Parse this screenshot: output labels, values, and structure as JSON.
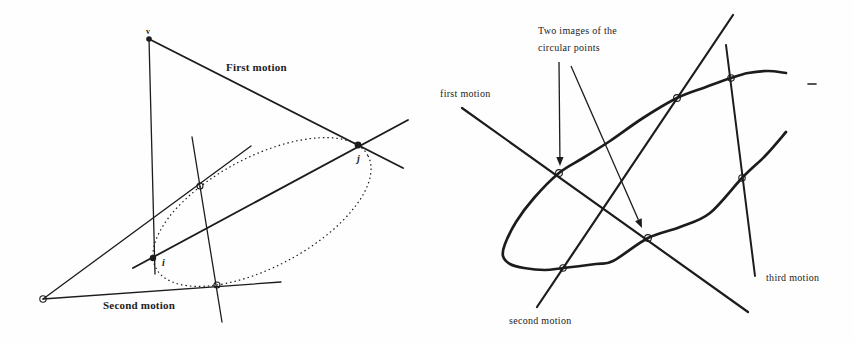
{
  "canvas": {
    "width": 854,
    "height": 342,
    "background": "#fefefe",
    "ink": "#1c1c1c"
  },
  "figures": [
    {
      "id": "left-figure",
      "description": "two-motion construction with dotted conic through circular points i and j",
      "labels": [
        {
          "id": "vertex-v-label",
          "text": "v",
          "x": 146,
          "y": 34,
          "cls": "lbl-tiny"
        },
        {
          "id": "first-motion-label",
          "text": "First motion",
          "x": 226,
          "y": 71,
          "cls": "lbl-bold"
        },
        {
          "id": "second-motion-label",
          "text": "Second motion",
          "x": 103,
          "y": 309,
          "cls": "lbl-bold"
        },
        {
          "id": "point-i-label",
          "text": "i",
          "x": 162,
          "y": 266,
          "cls": "lbl-pt"
        },
        {
          "id": "point-j-label",
          "text": "j",
          "x": 357,
          "y": 162,
          "cls": "lbl-pt"
        }
      ],
      "lines": [
        {
          "id": "vertical-axis-line",
          "x1": 149,
          "y1": 39,
          "x2": 155,
          "y2": 274,
          "w": 1.3
        },
        {
          "id": "first-motion-line",
          "x1": 149,
          "y1": 39,
          "x2": 403,
          "y2": 168,
          "w": 1.8
        },
        {
          "id": "i-j-diagonal-line",
          "x1": 133,
          "y1": 268,
          "x2": 408,
          "y2": 120,
          "w": 1.8
        },
        {
          "id": "upper-tangent-line",
          "x1": 43,
          "y1": 299,
          "x2": 251,
          "y2": 146,
          "w": 1.3
        },
        {
          "id": "second-motion-line",
          "x1": 43,
          "y1": 299,
          "x2": 281,
          "y2": 282,
          "w": 1.3
        },
        {
          "id": "tangency-chord-line",
          "x1": 192,
          "y1": 137,
          "x2": 222,
          "y2": 322,
          "w": 1.3
        }
      ],
      "dotted_ellipses": [
        {
          "id": "dotted-conic",
          "cx": 262,
          "cy": 212,
          "rx": 120,
          "ry": 55,
          "rotate": -28,
          "w": 1.2,
          "dash": "1.5 3"
        }
      ],
      "points": [
        {
          "id": "vertex-v-point",
          "x": 149,
          "y": 39,
          "type": "filled",
          "r": 2.8
        },
        {
          "id": "circular-point-i",
          "x": 153,
          "y": 258,
          "type": "filled",
          "r": 3.2
        },
        {
          "id": "circular-point-j",
          "x": 358,
          "y": 145,
          "type": "filled",
          "r": 3.4
        },
        {
          "id": "upper-tangency-point",
          "x": 200,
          "y": 186,
          "type": "open",
          "r": 3.0
        },
        {
          "id": "lower-tangency-point",
          "x": 217,
          "y": 285,
          "type": "open",
          "r": 3.0
        },
        {
          "id": "left-vertex-point",
          "x": 43,
          "y": 299,
          "type": "open",
          "r": 3.2
        }
      ]
    },
    {
      "id": "right-figure",
      "description": "bold conic with three motion lines meeting at two images of the circular points",
      "labels": [
        {
          "id": "annotation-line-1",
          "text": "Two images of the",
          "x": 538,
          "y": 34,
          "cls": "lbl"
        },
        {
          "id": "annotation-line-2",
          "text": "circular points",
          "x": 538,
          "y": 51,
          "cls": "lbl"
        },
        {
          "id": "first-motion-label",
          "text": "first motion",
          "x": 440,
          "y": 97,
          "cls": "lbl"
        },
        {
          "id": "second-motion-label",
          "text": "second motion",
          "x": 509,
          "y": 324,
          "cls": "lbl"
        },
        {
          "id": "third-motion-label",
          "text": "third motion",
          "x": 766,
          "y": 281,
          "cls": "lbl"
        }
      ],
      "lines": [
        {
          "id": "first-motion-line",
          "x1": 462,
          "y1": 108,
          "x2": 748,
          "y2": 312,
          "w": 2.2
        },
        {
          "id": "second-motion-line",
          "x1": 537,
          "y1": 307,
          "x2": 733,
          "y2": 15,
          "w": 2.2
        },
        {
          "id": "third-motion-line",
          "x1": 726,
          "y1": 45,
          "x2": 755,
          "y2": 276,
          "w": 2.0
        },
        {
          "id": "stray-dash-mark",
          "x1": 808,
          "y1": 84,
          "x2": 816,
          "y2": 84,
          "w": 1.6
        }
      ],
      "curves": [
        {
          "id": "bold-conic-arc",
          "w": 2.7,
          "points": [
            [
              786,
              73
            ],
            [
              768,
              71
            ],
            [
              748,
              73
            ],
            [
              731,
              78
            ],
            [
              706,
              87
            ],
            [
              677,
              98
            ],
            [
              643,
              118
            ],
            [
              610,
              141
            ],
            [
              583,
              158
            ],
            [
              559,
              173
            ],
            [
              534,
              198
            ],
            [
              516,
              222
            ],
            [
              505,
              244
            ],
            [
              503,
              256
            ],
            [
              510,
              264
            ],
            [
              524,
              268
            ],
            [
              545,
              270
            ],
            [
              563,
              268
            ],
            [
              596,
              264
            ],
            [
              613,
              261
            ],
            [
              648,
              238
            ],
            [
              680,
              227
            ],
            [
              710,
              213
            ],
            [
              742,
              178
            ],
            [
              766,
              155
            ],
            [
              786,
              132
            ]
          ]
        }
      ],
      "arrows": [
        {
          "id": "arrow-to-first-circular-point",
          "x1": 559,
          "y1": 62,
          "x2": 560,
          "y2": 166,
          "w": 1.3
        },
        {
          "id": "arrow-to-second-circular-point",
          "x1": 571,
          "y1": 66,
          "x2": 642,
          "y2": 228,
          "w": 1.3
        }
      ],
      "points": [
        {
          "id": "circular-point-image-1",
          "x": 559,
          "y": 173,
          "type": "open",
          "r": 3.4
        },
        {
          "id": "circular-point-image-2",
          "x": 648,
          "y": 238,
          "type": "open",
          "r": 3.4
        },
        {
          "id": "second-motion-lower-intersection",
          "x": 563,
          "y": 268,
          "type": "open",
          "r": 3.2
        },
        {
          "id": "second-motion-upper-intersection",
          "x": 677,
          "y": 98,
          "type": "open",
          "r": 3.4
        },
        {
          "id": "third-motion-upper-intersection",
          "x": 731,
          "y": 78,
          "type": "open",
          "r": 3.2
        },
        {
          "id": "third-motion-lower-intersection",
          "x": 742,
          "y": 178,
          "type": "open",
          "r": 3.2
        }
      ]
    }
  ]
}
